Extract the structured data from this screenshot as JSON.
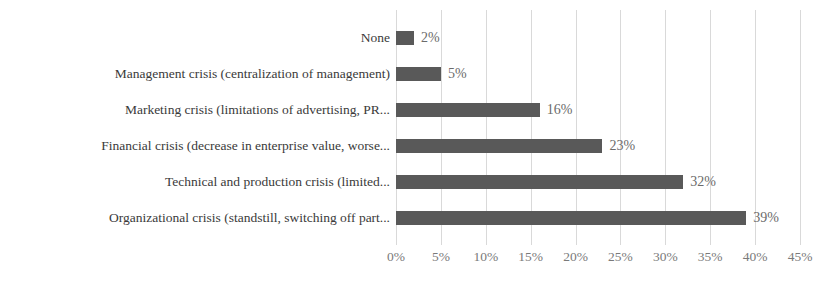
{
  "chart_data": {
    "type": "bar",
    "orientation": "horizontal",
    "title": "",
    "xlabel": "",
    "ylabel": "",
    "xlim": [
      0,
      45
    ],
    "xticks": [
      "0%",
      "5%",
      "10%",
      "15%",
      "20%",
      "25%",
      "30%",
      "35%",
      "40%",
      "45%"
    ],
    "xtick_values": [
      0,
      5,
      10,
      15,
      20,
      25,
      30,
      35,
      40,
      45
    ],
    "grid": true,
    "legend": false,
    "bar_color": "#595959",
    "gridline_color": "#d9d9d9",
    "label_color": "#3a3a3a",
    "value_color": "#6b6b6b",
    "categories": [
      "None",
      "Management crisis (centralization of management)",
      "Marketing crisis (limitations of advertising, PR...",
      "Financial crisis (decrease in enterprise value, worse...",
      "Technical and production crisis (limited...",
      "Organizational crisis (standstill, switching off part..."
    ],
    "values": [
      2,
      5,
      16,
      23,
      32,
      39
    ],
    "data_labels": [
      "2%",
      "5%",
      "16%",
      "23%",
      "32%",
      "39%"
    ]
  }
}
